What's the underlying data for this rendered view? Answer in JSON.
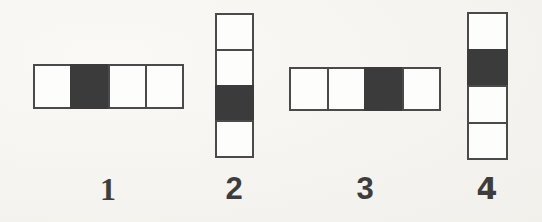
{
  "page": {
    "background_color": "#f7f5f1"
  },
  "style": {
    "cell_border_color": "#4a4a4a",
    "cell_empty_color": "#fdfdfb",
    "cell_filled_color": "#3b3b3b",
    "label_color": "#3d3d3d"
  },
  "figures": [
    {
      "id": "figure-1",
      "label": "1",
      "orientation": "horizontal",
      "cell_count": 4,
      "filled_index": 2,
      "cells": [
        "empty",
        "filled",
        "empty",
        "empty"
      ]
    },
    {
      "id": "figure-2",
      "label": "2",
      "orientation": "vertical",
      "cell_count": 4,
      "filled_index": 3,
      "cells": [
        "empty",
        "empty",
        "filled",
        "empty"
      ]
    },
    {
      "id": "figure-3",
      "label": "3",
      "orientation": "horizontal",
      "cell_count": 4,
      "filled_index": 3,
      "cells": [
        "empty",
        "empty",
        "filled",
        "empty"
      ]
    },
    {
      "id": "figure-4",
      "label": "4",
      "orientation": "vertical",
      "cell_count": 4,
      "filled_index": 2,
      "cells": [
        "empty",
        "filled",
        "empty",
        "empty"
      ]
    }
  ]
}
